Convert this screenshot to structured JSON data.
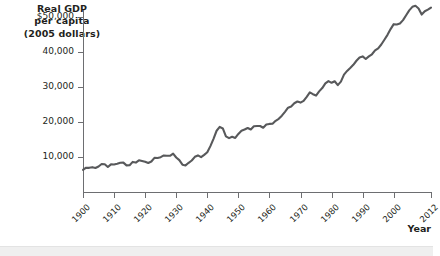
{
  "chart_data": {
    "type": "line",
    "title": "",
    "ylabel_lines": [
      "Real GDP",
      "per capita",
      "(2005 dollars)"
    ],
    "xlabel": "Year",
    "xlim": [
      1900,
      2012
    ],
    "ylim": [
      0,
      52000
    ],
    "grid": false,
    "legend": null,
    "line_color": "#58595b",
    "axis_color": "#6d6e71",
    "y_ticks": [
      {
        "value": 50000,
        "label": "$50,000"
      },
      {
        "value": 40000,
        "label": "40,000"
      },
      {
        "value": 30000,
        "label": "30,000"
      },
      {
        "value": 20000,
        "label": "20,000"
      },
      {
        "value": 10000,
        "label": "10,000"
      }
    ],
    "x_ticks": [
      {
        "value": 1900,
        "label": "1900"
      },
      {
        "value": 1910,
        "label": "1910"
      },
      {
        "value": 1920,
        "label": "1920"
      },
      {
        "value": 1930,
        "label": "1930"
      },
      {
        "value": 1940,
        "label": "1940"
      },
      {
        "value": 1950,
        "label": "1950"
      },
      {
        "value": 1960,
        "label": "1960"
      },
      {
        "value": 1970,
        "label": "1970"
      },
      {
        "value": 1980,
        "label": "1980"
      },
      {
        "value": 1990,
        "label": "1990"
      },
      {
        "value": 2000,
        "label": "2000"
      },
      {
        "value": 2012,
        "label": "2012"
      }
    ],
    "x": [
      1900,
      1901,
      1902,
      1903,
      1904,
      1905,
      1906,
      1907,
      1908,
      1909,
      1910,
      1911,
      1912,
      1913,
      1914,
      1915,
      1916,
      1917,
      1918,
      1919,
      1920,
      1921,
      1922,
      1923,
      1924,
      1925,
      1926,
      1927,
      1928,
      1929,
      1930,
      1931,
      1932,
      1933,
      1934,
      1935,
      1936,
      1937,
      1938,
      1939,
      1940,
      1941,
      1942,
      1943,
      1944,
      1945,
      1946,
      1947,
      1948,
      1949,
      1950,
      1951,
      1952,
      1953,
      1954,
      1955,
      1956,
      1957,
      1958,
      1959,
      1960,
      1961,
      1962,
      1963,
      1964,
      1965,
      1966,
      1967,
      1968,
      1969,
      1970,
      1971,
      1972,
      1973,
      1974,
      1975,
      1976,
      1977,
      1978,
      1979,
      1980,
      1981,
      1982,
      1983,
      1984,
      1985,
      1986,
      1987,
      1988,
      1989,
      1990,
      1991,
      1992,
      1993,
      1994,
      1995,
      1996,
      1997,
      1998,
      1999,
      2000,
      2001,
      2002,
      2003,
      2004,
      2005,
      2006,
      2007,
      2008,
      2009,
      2010,
      2011,
      2012
    ],
    "y": [
      6300,
      6950,
      6900,
      7100,
      6850,
      7300,
      8000,
      7950,
      7150,
      7900,
      7850,
      8050,
      8350,
      8400,
      7600,
      7650,
      8600,
      8400,
      9050,
      8850,
      8650,
      8300,
      8700,
      9750,
      9700,
      9950,
      10450,
      10350,
      10350,
      10950,
      9850,
      9100,
      7800,
      7600,
      8350,
      9000,
      10050,
      10450,
      9950,
      10600,
      11350,
      13100,
      15200,
      17500,
      18600,
      18150,
      15900,
      15400,
      15800,
      15450,
      16600,
      17500,
      17850,
      18300,
      17850,
      18800,
      18850,
      18850,
      18350,
      19300,
      19450,
      19500,
      20350,
      20900,
      21800,
      22900,
      24100,
      24450,
      25350,
      25850,
      25550,
      26050,
      27200,
      28450,
      27950,
      27550,
      28750,
      29700,
      31050,
      31700,
      31200,
      31650,
      30550,
      31550,
      33550,
      34600,
      35450,
      36350,
      37500,
      38450,
      38750,
      38000,
      38750,
      39350,
      40450,
      41050,
      42150,
      43500,
      44900,
      46550,
      47950,
      47850,
      48150,
      49100,
      50500,
      51900,
      52900,
      53200,
      52450,
      50700,
      51650,
      52100,
      52700
    ]
  }
}
